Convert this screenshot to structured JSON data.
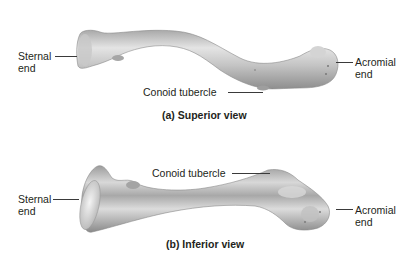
{
  "figure": {
    "colors": {
      "bone_light": "#e2e2e2",
      "bone_mid": "#b4b4b4",
      "bone_dark": "#8a8a8a",
      "text": "#231f20",
      "leader": "#3a3a3a"
    }
  },
  "superior_view": {
    "caption": "(a) Superior view",
    "labels": {
      "sternal_end_line1": "Sternal",
      "sternal_end_line2": "end",
      "acromial_end_line1": "Acromial",
      "acromial_end_line2": "end",
      "conoid_tubercle": "Conoid tubercle"
    }
  },
  "inferior_view": {
    "caption": "(b) Inferior view",
    "labels": {
      "sternal_end_line1": "Sternal",
      "sternal_end_line2": "end",
      "acromial_end_line1": "Acromial",
      "acromial_end_line2": "end",
      "conoid_tubercle": "Conoid tubercle"
    }
  }
}
